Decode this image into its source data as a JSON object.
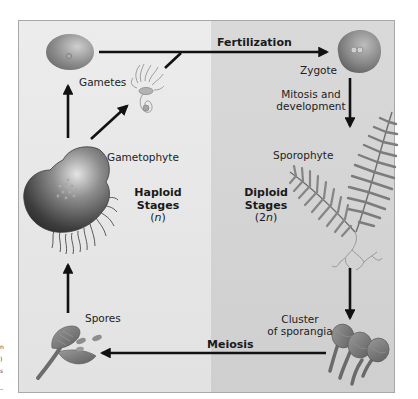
{
  "diagram": {
    "type": "life-cycle",
    "colors": {
      "haploid_bg": "#e6e6e6",
      "diploid_bg": "#d5d5d5",
      "frame_border": "#a8a8a8",
      "arrow": "#111111",
      "structure_fill": "#8a8a8a"
    },
    "regions": {
      "haploid": {
        "title": "Haploid",
        "subtitle": "Stages",
        "ploidy_open": "(",
        "ploidy_var": "n",
        "ploidy_close": ")"
      },
      "diploid": {
        "title": "Diploid",
        "subtitle": "Stages",
        "ploidy_open": "(2",
        "ploidy_var": "n",
        "ploidy_close": ")"
      }
    },
    "structures": {
      "gametes": "Gametes",
      "zygote": "Zygote",
      "sporophyte": "Sporophyte",
      "sporangia_line1": "Cluster",
      "sporangia_line2": "of sporangia",
      "spores": "Spores",
      "gametophyte": "Gametophyte"
    },
    "processes": {
      "fertilization": "Fertilization",
      "mitosis_line1": "Mitosis and",
      "mitosis_line2": "development",
      "meiosis": "Meiosis"
    },
    "nodes": [
      {
        "id": "gametes",
        "label": "Gametes",
        "ploidy": "n"
      },
      {
        "id": "zygote",
        "label": "Zygote",
        "ploidy": "2n"
      },
      {
        "id": "sporophyte",
        "label": "Sporophyte",
        "ploidy": "2n"
      },
      {
        "id": "sporangia",
        "label": "Cluster of sporangia",
        "ploidy": "2n"
      },
      {
        "id": "spores",
        "label": "Spores",
        "ploidy": "n"
      },
      {
        "id": "gametophyte",
        "label": "Gametophyte",
        "ploidy": "n"
      }
    ],
    "edges": [
      {
        "from": "gametes",
        "to": "zygote",
        "label": "Fertilization"
      },
      {
        "from": "zygote",
        "to": "sporophyte",
        "label": "Mitosis and development"
      },
      {
        "from": "sporophyte",
        "to": "sporangia",
        "label": ""
      },
      {
        "from": "sporangia",
        "to": "spores",
        "label": "Meiosis"
      },
      {
        "from": "spores",
        "to": "gametophyte",
        "label": ""
      },
      {
        "from": "gametophyte",
        "to": "gametes",
        "label": ""
      }
    ]
  },
  "margin_fragments": [
    "n",
    ")",
    "s",
    "–"
  ]
}
